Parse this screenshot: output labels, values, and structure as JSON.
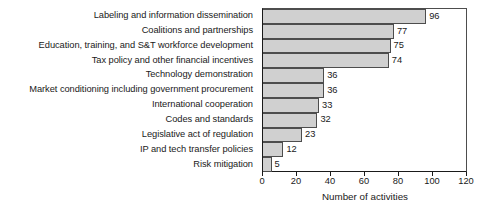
{
  "chart_data": {
    "type": "bar",
    "orientation": "horizontal",
    "title": "",
    "xlabel": "Number of activities",
    "ylabel": "",
    "xlim": [
      0,
      120
    ],
    "xticks": [
      0,
      20,
      40,
      60,
      80,
      100,
      120
    ],
    "grid": false,
    "legend": null,
    "bar_fill_color": "#d0d0d0",
    "bar_edge_color": "#4d4d4d",
    "categories": [
      "Labeling and information dissemination",
      "Coalitions and partnerships",
      "Education, training, and S&T workforce development",
      "Tax policy and other financial incentives",
      "Technology demonstration",
      "Market conditioning including government procurement",
      "International cooperation",
      "Codes and standards",
      "Legislative act of regulation",
      "IP and tech transfer policies",
      "Risk mitigation"
    ],
    "values": [
      96,
      77,
      75,
      74,
      36,
      36,
      33,
      32,
      23,
      12,
      5
    ],
    "data_labels": [
      "96",
      "77",
      "75",
      "74",
      "36",
      "36",
      "33",
      "32",
      "23",
      "12",
      "5"
    ]
  }
}
